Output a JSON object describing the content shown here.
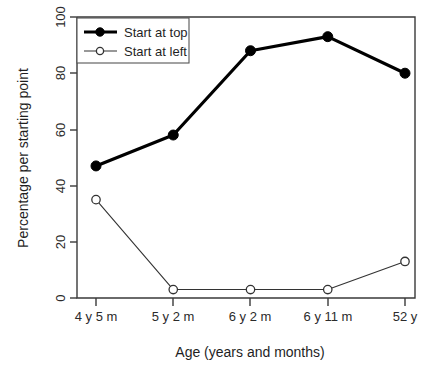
{
  "chart_data": {
    "type": "line",
    "title": "",
    "xlabel": "Age (years and months)",
    "ylabel": "Percentage per starting point",
    "categories": [
      "4 y 5 m",
      "5 y 2 m",
      "6 y 2 m",
      "6 y 11 m",
      "52 y"
    ],
    "ylim": [
      0,
      100
    ],
    "yticks": [
      0,
      20,
      40,
      60,
      80,
      100
    ],
    "grid": false,
    "legend_position": "top-left",
    "series": [
      {
        "name": "Start at top",
        "values": [
          47,
          58,
          88,
          93,
          80
        ],
        "marker": "filled-circle",
        "line_width": "thick",
        "color": "#000000"
      },
      {
        "name": "Start at left",
        "values": [
          35,
          3,
          3,
          3,
          13
        ],
        "marker": "open-circle",
        "line_width": "thin",
        "color": "#333333"
      }
    ]
  },
  "axes": {
    "y_tick_labels": [
      "0",
      "20",
      "40",
      "60",
      "80",
      "100"
    ],
    "x_tick_labels": [
      "4 y 5 m",
      "5 y 2 m",
      "6 y 2 m",
      "6 y 11 m",
      "52 y"
    ],
    "y_axis_title": "Percentage per starting point",
    "x_axis_title": "Age (years and months)"
  },
  "legend": {
    "entries": [
      {
        "label": "Start at top"
      },
      {
        "label": "Start at left"
      }
    ]
  }
}
